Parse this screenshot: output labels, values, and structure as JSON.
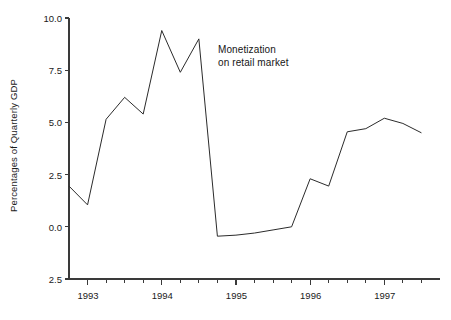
{
  "chart_data": {
    "type": "line",
    "title": "",
    "subtitle": "",
    "xlabel": "",
    "ylabel": "Percentages of Quarterly GDP",
    "grid": false,
    "legend_position": "none",
    "annotations": [
      {
        "name": "series-annotation",
        "line1": "Monetization",
        "line2": "on retail market",
        "x_px": 218,
        "y_px": 44
      }
    ],
    "xlim": [
      1992.75,
      1997.75
    ],
    "ylim": [
      -2.5,
      10.0
    ],
    "y_ticks": [
      10.0,
      7.5,
      5.0,
      2.5,
      0.0,
      -2.5
    ],
    "y_tick_labels": [
      "10.0",
      "7.5",
      "5.0",
      "2.5",
      "0.0",
      "2.5"
    ],
    "x_ticks": [
      1993.0,
      1994.0,
      1995.0,
      1996.0,
      1997.0
    ],
    "x_tick_labels": [
      "1993",
      "1994",
      "1995",
      "1996",
      "1997"
    ],
    "x_minor_ticks": [
      1993.0,
      1993.25,
      1993.5,
      1993.75,
      1994.0,
      1994.25,
      1994.5,
      1994.75,
      1995.0,
      1995.25,
      1995.5,
      1995.75,
      1996.0,
      1996.25,
      1996.5,
      1996.75,
      1997.0,
      1997.25,
      1997.5
    ],
    "line_color": "#2b2b2b",
    "line_width": 1,
    "series": [
      {
        "name": "Monetization on retail market",
        "x": [
          1992.75,
          1993.0,
          1993.25,
          1993.5,
          1993.75,
          1994.0,
          1994.25,
          1994.5,
          1994.75,
          1995.0,
          1995.25,
          1995.5,
          1995.75,
          1996.0,
          1996.25,
          1996.5,
          1996.75,
          1997.0,
          1997.25,
          1997.5
        ],
        "values": [
          1.95,
          1.05,
          5.15,
          6.2,
          5.4,
          9.4,
          7.4,
          9.0,
          -0.45,
          -0.4,
          -0.3,
          -0.15,
          0.0,
          2.3,
          1.95,
          4.55,
          4.7,
          5.2,
          4.95,
          4.5
        ]
      }
    ]
  }
}
